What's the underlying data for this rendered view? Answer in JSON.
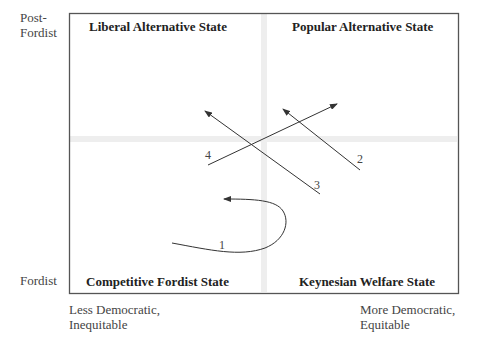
{
  "axes": {
    "y_top": "Post-\nFordist",
    "y_top_line1": "Post-",
    "y_top_line2": "Fordist",
    "y_bottom": "Fordist",
    "x_left_line1": "Less Democratic,",
    "x_left_line2": "Inequitable",
    "x_right_line1": "More Democratic,",
    "x_right_line2": "Equitable"
  },
  "quadrants": {
    "top_left": "Liberal Alternative State",
    "top_right": "Popular Alternative State",
    "bottom_left": "Competitive Fordist State",
    "bottom_right": "Keynesian Welfare State"
  },
  "paths": [
    {
      "id": "1",
      "label": "1",
      "type": "curve"
    },
    {
      "id": "2",
      "label": "2",
      "type": "arrow"
    },
    {
      "id": "3",
      "label": "3",
      "type": "arrow"
    },
    {
      "id": "4",
      "label": "4",
      "type": "arrow"
    }
  ],
  "colors": {
    "border": "#555555",
    "divider": "#eeeeee",
    "line": "#333333"
  }
}
